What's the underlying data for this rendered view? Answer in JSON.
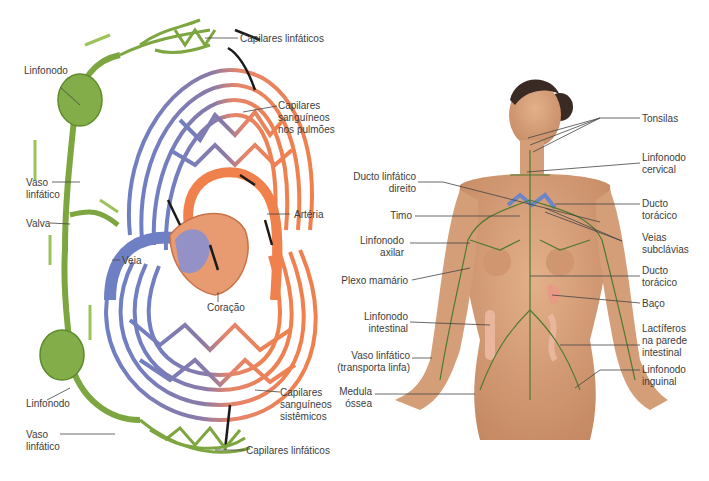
{
  "left_diagram": {
    "title": "Circulação sanguínea e linfática",
    "labels": {
      "cap_linf_top": "Capilares linfáticos",
      "linfonodo_top": "Linfonodo",
      "cap_sang_pulm": [
        "Capilares",
        "sanguíneos",
        "nos pulmões"
      ],
      "vaso_linf_top": [
        "Vaso",
        "linfático"
      ],
      "valva": "Valva",
      "arteria": "Artéria",
      "veia": "Veia",
      "coracao": "Coração",
      "linfonodo_bottom": "Linfonodo",
      "cap_sang_sist": [
        "Capilares",
        "sanguíneos",
        "sistêmicos"
      ],
      "vaso_linf_bottom": [
        "Vaso",
        "linfático"
      ],
      "cap_linf_bottom": "Capilares linfáticos"
    },
    "colors": {
      "lymph": "#7da640",
      "lymph_dark": "#5d8a2a",
      "vein": "#6f7fc4",
      "artery": "#f0804c",
      "heart": "#e89a70",
      "arrow": "#1a1a1a"
    }
  },
  "right_diagram": {
    "title": "Sistema linfático no corpo humano",
    "labels": {
      "tonsilas": "Tonsilas",
      "linfonodo_cervical": [
        "Linfonodo",
        "cervical"
      ],
      "ducto_linf_direito": [
        "Ducto linfático",
        "direito"
      ],
      "ducto_toracico_1": [
        "Ducto",
        "torácico"
      ],
      "timo": "Timo",
      "veias_subclavias": [
        "Veias",
        "subclávias"
      ],
      "linfonodo_axilar": [
        "Linfonodo",
        "axilar"
      ],
      "ducto_toracico_2": [
        "Ducto",
        "torácico"
      ],
      "plexo_mamario": "Plexo mamário",
      "baco": "Baço",
      "linfonodo_intestinal": [
        "Linfonodo",
        "intestinal"
      ],
      "lactiferos": [
        "Lactíferos",
        "na parede",
        "intestinal"
      ],
      "vaso_linf_transp": [
        "Vaso linfático",
        "(transporta linfa)"
      ],
      "linfonodo_inguinal": [
        "Linfonodo",
        "inguinal"
      ],
      "medula_ossea": [
        "Medula",
        "óssea"
      ]
    },
    "colors": {
      "skin": "#d9a27c",
      "skin_shadow": "#c08660",
      "hair": "#3a2a24",
      "lymph": "#4f7a2e",
      "vein": "#6a86c8",
      "spleen": "#e89a84"
    }
  }
}
